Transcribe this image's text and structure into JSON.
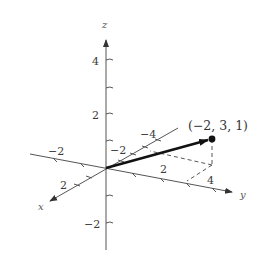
{
  "diagram": {
    "type": "3d-coordinate-vector",
    "axes": {
      "x": {
        "label": "x",
        "ticks": [
          "2",
          "−2"
        ]
      },
      "y": {
        "label": "y",
        "ticks": [
          "−2",
          "2",
          "4"
        ]
      },
      "z": {
        "label": "z",
        "ticks": [
          "4",
          "2",
          "−2"
        ],
        "yback_ticks": [
          "−2",
          "−4"
        ]
      }
    },
    "point": {
      "label": "(−2,  3,  1)",
      "x": -2,
      "y": 3,
      "z": 1
    },
    "colors": {
      "axis": "#555555",
      "vector": "#1a1a1a",
      "dash": "#444444"
    }
  }
}
